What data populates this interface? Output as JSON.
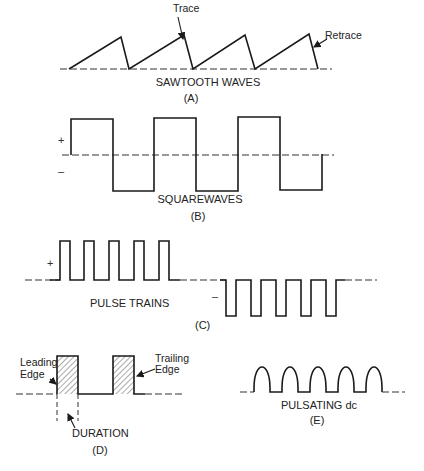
{
  "diagram": {
    "panels": [
      {
        "id": "A",
        "caption": "SAWTOOTH WAVES",
        "letter": "(A)",
        "annotations": {
          "trace": "Trace",
          "retrace": "Retrace"
        },
        "cycles": 4
      },
      {
        "id": "B",
        "caption": "SQUAREWAVES",
        "letter": "(B)",
        "signs": {
          "plus": "+",
          "minus": "–"
        },
        "half_cycles": 6
      },
      {
        "id": "C",
        "caption": "PULSE TRAINS",
        "letter": "(C)",
        "signs": {
          "plus": "+",
          "minus": "–"
        },
        "positive_pulses": 5,
        "negative_pulses": 5
      },
      {
        "id": "D",
        "caption": "DURATION",
        "letter": "(D)",
        "annotations": {
          "leading_edge_1": "Leading",
          "leading_edge_2": "Edge",
          "trailing_edge_1": "Trailing",
          "trailing_edge_2": "Edge"
        },
        "pulses": 2
      },
      {
        "id": "E",
        "caption": "PULSATING dc",
        "letter": "(E)",
        "humps": 5
      }
    ]
  },
  "colors": {
    "ink": "#1a1a1a",
    "background": "#ffffff"
  }
}
